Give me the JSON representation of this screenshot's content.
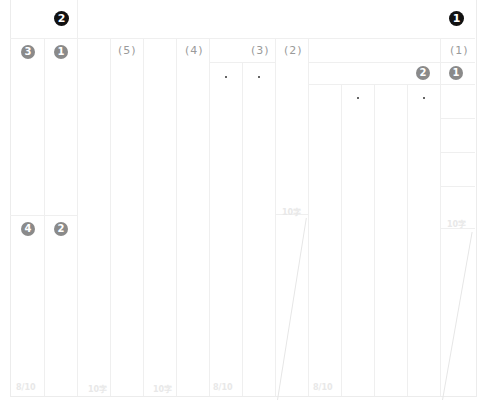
{
  "header": {
    "left_badge": "2",
    "right_badge": "1"
  },
  "left_panel": {
    "top_badges": [
      "3",
      "1"
    ],
    "bottom_badges": [
      "4",
      "2"
    ],
    "footer_count": "8/10"
  },
  "sections": [
    {
      "label": "(5)",
      "footer_count": "10字"
    },
    {
      "label": "(4)",
      "footer_count": "10字"
    },
    {
      "label": "(3)",
      "footer_count": "8/10"
    },
    {
      "label": "(2)",
      "footer_count": "10字"
    },
    {
      "label": "(1)",
      "footer_count": "10字"
    }
  ],
  "subsection": {
    "badges": [
      "2",
      "1"
    ],
    "footer_count": "8/10"
  }
}
